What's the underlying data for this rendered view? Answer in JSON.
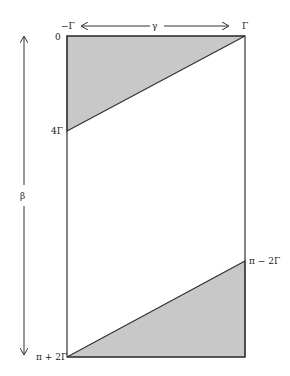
{
  "diagram": {
    "labels": {
      "top_left": "−Γ",
      "top_right": "Γ",
      "gamma": "γ",
      "zero": "0",
      "four_gamma": "4Γ",
      "pi_minus_2gamma": "π − 2Γ",
      "pi_plus_2gamma": "π + 2Γ",
      "beta": "β"
    },
    "colors": {
      "shade": "#c8c8c8",
      "stroke": "#333333"
    }
  }
}
